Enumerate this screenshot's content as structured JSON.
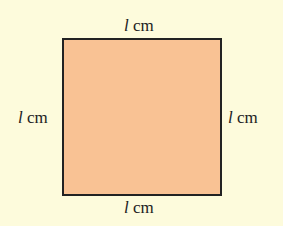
{
  "diagram": {
    "shape": "square",
    "fill_color": "#f9c294",
    "stroke_color": "#222222",
    "background_color": "#fdfbdc",
    "labels": {
      "top": {
        "var": "l",
        "unit": "cm"
      },
      "bottom": {
        "var": "l",
        "unit": "cm"
      },
      "left": {
        "var": "l",
        "unit": "cm"
      },
      "right": {
        "var": "l",
        "unit": "cm"
      }
    }
  }
}
